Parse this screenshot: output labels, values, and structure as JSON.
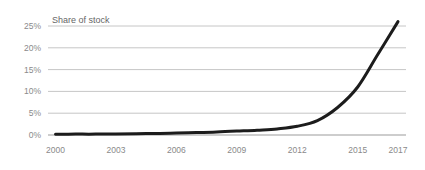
{
  "chart_data": {
    "type": "line",
    "title": "Share of stock",
    "series_name": "Share of stock",
    "x": [
      2000,
      2001,
      2002,
      2003,
      2004,
      2005,
      2006,
      2007,
      2008,
      2009,
      2010,
      2011,
      2012,
      2013,
      2014,
      2015,
      2016,
      2017
    ],
    "values": [
      0.15,
      0.2,
      0.2,
      0.25,
      0.3,
      0.35,
      0.45,
      0.55,
      0.7,
      0.9,
      1.1,
      1.4,
      2.0,
      3.3,
      6.3,
      11.0,
      18.5,
      26.0
    ],
    "xlim": [
      2000,
      2017
    ],
    "ylim": [
      0,
      25
    ],
    "x_ticks": [
      2000,
      2003,
      2006,
      2009,
      2012,
      2015,
      2017
    ],
    "x_tick_labels": [
      "2000",
      "2003",
      "2006",
      "2009",
      "2012",
      "2015",
      "2017"
    ],
    "y_ticks": [
      0,
      5,
      10,
      15,
      20,
      25
    ],
    "y_tick_labels": [
      "0%",
      "5%",
      "10%",
      "15%",
      "20%",
      "25%"
    ],
    "grid": "horizontal",
    "legend": "none",
    "colors": {
      "line": "#1c1c1c",
      "grid": "#c6c6c6",
      "axis": "#9b9b9b",
      "tick_label": "#8a8a8a",
      "title": "#666666",
      "background": "#ffffff"
    }
  }
}
